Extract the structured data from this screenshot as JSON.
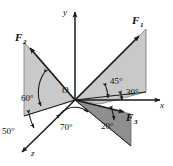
{
  "figure": {
    "type": "3d-force-vector-diagram",
    "background_color": "#ffffff",
    "line_color": "#1a1a1a",
    "plane_fill_light": "#c9c9c9",
    "plane_fill_dark": "#8f8f8f"
  },
  "axes": {
    "origin_label": "O",
    "x_label": "x",
    "y_label": "y",
    "z_label": "z"
  },
  "vectors": [
    {
      "name": "F1",
      "label": "F",
      "subscript": "1"
    },
    {
      "name": "F2",
      "label": "F",
      "subscript": "2"
    },
    {
      "name": "F3",
      "label": "F",
      "subscript": "3"
    }
  ],
  "angles": [
    {
      "id": "a45",
      "value": "45°"
    },
    {
      "id": "a30",
      "value": "30°"
    },
    {
      "id": "a60",
      "value": "60°"
    },
    {
      "id": "a50",
      "value": "50°"
    },
    {
      "id": "a70",
      "value": "70°"
    },
    {
      "id": "a20",
      "value": "20°"
    }
  ]
}
